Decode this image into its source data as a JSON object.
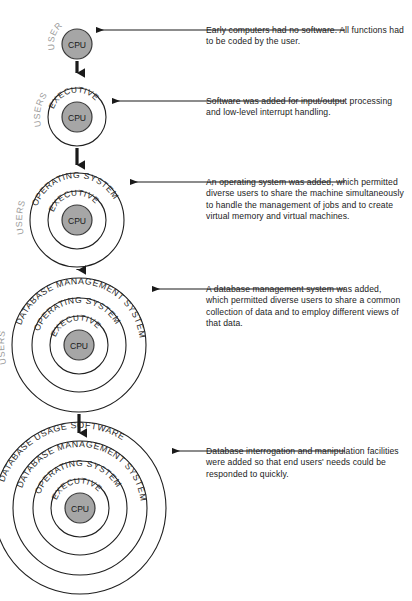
{
  "figure": {
    "type": "concentric-ring-evolution-diagram",
    "title": "",
    "background_color": "#ffffff",
    "core_label": "CPU",
    "core_fill": "#a6a6a6",
    "core_stroke": "#3a3a3a",
    "users_label": "USERS",
    "users_color": "#9a9a9a",
    "ring_stroke": "#1f1f1f",
    "arrow_color": "#1a1a1a"
  },
  "stages": [
    {
      "id": "stage-1",
      "index": 1,
      "cx": 77,
      "cy": 44,
      "core_r": 15,
      "rings": [],
      "outer_r": 15,
      "users_r": 23,
      "leader_y": 30,
      "caption": "Early computers had no software. All functions had to be coded by the user."
    },
    {
      "id": "stage-2",
      "index": 2,
      "cx": 77,
      "cy": 117,
      "core_r": 15,
      "rings": [
        {
          "label": "EXECUTIVE",
          "r": 29,
          "text_r": 24.5,
          "font_size": 8.2
        }
      ],
      "outer_r": 29,
      "users_r": 37,
      "leader_y": 101,
      "caption": "Software was added for input/output processing and low-level interrupt handling."
    },
    {
      "id": "stage-3",
      "index": 3,
      "cx": 77,
      "cy": 220,
      "core_r": 15,
      "rings": [
        {
          "label": "EXECUTIVE",
          "r": 29,
          "text_r": 24.5,
          "font_size": 8.2
        },
        {
          "label": "OPERATING SYSTEM",
          "r": 47,
          "text_r": 42,
          "font_size": 8.6
        }
      ],
      "outer_r": 47,
      "users_r": 55,
      "leader_y": 182,
      "caption": "An operating system was added, which permitted diverse users to share the machine simultaneously to handle the management of jobs and to create virtual memory and virtual machines."
    },
    {
      "id": "stage-4",
      "index": 4,
      "cx": 79,
      "cy": 345,
      "core_r": 15,
      "rings": [
        {
          "label": "EXECUTIVE",
          "r": 29,
          "text_r": 24.5,
          "font_size": 8.2
        },
        {
          "label": "OPERATING SYSTEM",
          "r": 47,
          "text_r": 42,
          "font_size": 8.6
        },
        {
          "label": "DATABASE MANAGEMENT SYSTEM",
          "r": 67,
          "text_r": 61,
          "font_size": 8.8
        }
      ],
      "outer_r": 67,
      "users_r": 75,
      "leader_y": 289,
      "caption": "A database management system was added, which permitted diverse users to share a common collection of data and to employ different views of that data."
    },
    {
      "id": "stage-5",
      "index": 5,
      "cx": 80,
      "cy": 508,
      "core_r": 15,
      "rings": [
        {
          "label": "EXECUTIVE",
          "r": 29,
          "text_r": 24.5,
          "font_size": 8.2
        },
        {
          "label": "OPERATING SYSTEM",
          "r": 47,
          "text_r": 42,
          "font_size": 8.6
        },
        {
          "label": "DATABASE MANAGEMENT SYSTEM",
          "r": 67,
          "text_r": 61,
          "font_size": 8.8
        },
        {
          "label": "DATABASE USAGE SOFTWARE",
          "r": 86,
          "text_r": 80,
          "font_size": 8.8
        }
      ],
      "outer_r": 86,
      "users_r": 94,
      "leader_y": 451,
      "caption": "Database interrogation and manipulation facilities were added so that end users' needs could be responded to quickly."
    }
  ],
  "leaders": {
    "text_x": 206,
    "line_start_x": 345,
    "arrow_head": "left"
  },
  "down_arrows": [
    {
      "from_stage": 1,
      "to_stage": 2,
      "x": 77,
      "y1": 61,
      "y2": 79
    },
    {
      "from_stage": 2,
      "to_stage": 3,
      "x": 77,
      "y1": 148,
      "y2": 171
    },
    {
      "from_stage": 3,
      "to_stage": 4,
      "x": 78,
      "y1": 269,
      "y2": 276
    },
    {
      "from_stage": 4,
      "to_stage": 5,
      "x": 79,
      "y1": 414,
      "y2": 439
    }
  ]
}
